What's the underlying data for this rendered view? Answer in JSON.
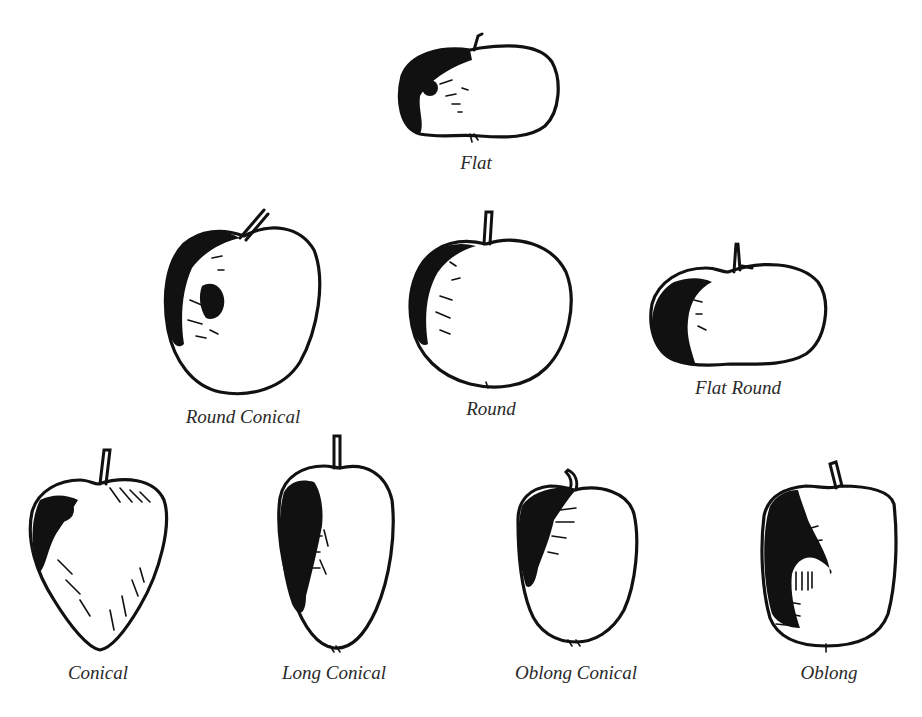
{
  "diagram": {
    "rows": [
      {
        "items": [
          {
            "id": "flat",
            "label": "Flat"
          }
        ]
      },
      {
        "items": [
          {
            "id": "round-conical",
            "label": "Round Conical"
          },
          {
            "id": "round",
            "label": "Round"
          },
          {
            "id": "flat-round",
            "label": "Flat Round"
          }
        ]
      },
      {
        "items": [
          {
            "id": "conical",
            "label": "Conical"
          },
          {
            "id": "long-conical",
            "label": "Long Conical"
          },
          {
            "id": "oblong-conical",
            "label": "Oblong Conical"
          },
          {
            "id": "oblong",
            "label": "Oblong"
          }
        ]
      }
    ],
    "colors": {
      "ink": "#111111",
      "label": "#2a2a2a",
      "background": "#ffffff"
    }
  }
}
